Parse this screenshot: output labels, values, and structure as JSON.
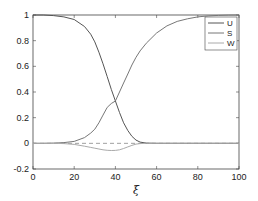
{
  "chart_data": {
    "type": "line",
    "title": "",
    "xlabel": "ξ",
    "ylabel": "",
    "xlim": [
      0,
      100
    ],
    "ylim": [
      -0.2,
      1
    ],
    "xticks": [
      0,
      20,
      40,
      60,
      80,
      100
    ],
    "yticks": [
      -0.2,
      0,
      0.2,
      0.4,
      0.6,
      0.8,
      1
    ],
    "xtick_labels": [
      "0",
      "20",
      "40",
      "60",
      "80",
      "100"
    ],
    "ytick_labels": [
      "-0.2",
      "0",
      "0.2",
      "0.4",
      "0.6",
      "0.8",
      "1"
    ],
    "grid": false,
    "legend_position": "upper right",
    "reference_line": {
      "y": 0,
      "style": "dashed",
      "color": "#888888"
    },
    "x": [
      0,
      5,
      10,
      15,
      20,
      25,
      28,
      30,
      32,
      34,
      36,
      38,
      40,
      42,
      44,
      46,
      48,
      50,
      52,
      55,
      60,
      65,
      70,
      75,
      80,
      85,
      90,
      95,
      100
    ],
    "series": [
      {
        "name": "U",
        "color": "#555555",
        "values": [
          1.0,
          1.0,
          0.995,
          0.985,
          0.965,
          0.91,
          0.85,
          0.79,
          0.71,
          0.62,
          0.52,
          0.42,
          0.33,
          0.24,
          0.16,
          0.1,
          0.055,
          0.025,
          0.01,
          0.002,
          0,
          0,
          0,
          0,
          0,
          0,
          0,
          0,
          0
        ]
      },
      {
        "name": "S",
        "color": "#777777",
        "values": [
          0,
          0,
          0.002,
          0.006,
          0.015,
          0.045,
          0.08,
          0.11,
          0.16,
          0.22,
          0.28,
          0.31,
          0.33,
          0.4,
          0.47,
          0.54,
          0.61,
          0.67,
          0.72,
          0.78,
          0.86,
          0.915,
          0.95,
          0.97,
          0.985,
          0.993,
          0.997,
          0.999,
          1.0
        ]
      },
      {
        "name": "W",
        "color": "#aaaaaa",
        "values": [
          0,
          0,
          0,
          -0.002,
          -0.008,
          -0.022,
          -0.032,
          -0.038,
          -0.044,
          -0.05,
          -0.054,
          -0.056,
          -0.055,
          -0.05,
          -0.04,
          -0.028,
          -0.016,
          -0.006,
          -0.002,
          0,
          0,
          0,
          0,
          0,
          0,
          0,
          0,
          0,
          0
        ]
      }
    ]
  }
}
